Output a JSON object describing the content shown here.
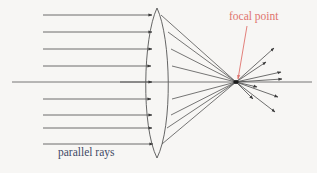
{
  "figure": {
    "kind": "optics-ray-diagram",
    "background_color": "#f7f6f4"
  },
  "labels": {
    "focal_point": {
      "text": "focal point",
      "color": "#e0736d",
      "x": 229,
      "y": 11
    },
    "parallel_rays": {
      "text": "parallel rays",
      "color": "#3f4a66",
      "x": 58,
      "y": 147
    }
  },
  "colors": {
    "ray": "#4a4a4a",
    "lens": "#555555",
    "axis": "#4a4a4a",
    "pointer": "#e0736d",
    "focal_dot": "#1a1a1a"
  },
  "geometry": {
    "lens": {
      "top_apex_x": 157,
      "top_apex_y": 8,
      "bottom_apex_x": 157,
      "bottom_apex_y": 158,
      "left_bulge_x": 141,
      "right_bulge_x": 173,
      "center_y": 83
    },
    "focal_point": {
      "x": 236,
      "y": 82
    },
    "optical_axis": {
      "y": 82,
      "x_start": 12,
      "x_end": 312
    },
    "incoming_ray_start_x": 43,
    "lens_hit_x": 152
  },
  "incoming_rays": [
    {
      "id": 1,
      "y": 15,
      "start_x": 43,
      "end_x": 152
    },
    {
      "id": 2,
      "y": 32,
      "start_x": 43,
      "end_x": 152
    },
    {
      "id": 3,
      "y": 49,
      "start_x": 43,
      "end_x": 152
    },
    {
      "id": 4,
      "y": 66,
      "start_x": 43,
      "end_x": 152
    },
    {
      "id": 5,
      "y": 82,
      "start_x": 12,
      "end_x": 152
    },
    {
      "id": 6,
      "y": 99,
      "start_x": 43,
      "end_x": 152
    },
    {
      "id": 7,
      "y": 115,
      "start_x": 43,
      "end_x": 152
    },
    {
      "id": 8,
      "y": 128,
      "start_x": 43,
      "end_x": 152
    },
    {
      "id": 9,
      "y": 144,
      "start_x": 43,
      "end_x": 152
    }
  ],
  "refracted_rays": [
    {
      "id": 1,
      "from_x": 166,
      "from_y": 18,
      "to_x": 236,
      "to_y": 82
    },
    {
      "id": 2,
      "from_x": 170,
      "from_y": 34,
      "to_x": 236,
      "to_y": 82
    },
    {
      "id": 3,
      "from_x": 172,
      "from_y": 50,
      "to_x": 236,
      "to_y": 82
    },
    {
      "id": 4,
      "from_x": 173,
      "from_y": 66,
      "to_x": 236,
      "to_y": 82
    },
    {
      "id": 5,
      "from_x": 173,
      "from_y": 82,
      "to_x": 236,
      "to_y": 82
    },
    {
      "id": 6,
      "from_x": 173,
      "from_y": 99,
      "to_x": 236,
      "to_y": 82
    },
    {
      "id": 7,
      "from_x": 172,
      "from_y": 114,
      "to_x": 236,
      "to_y": 82
    },
    {
      "id": 8,
      "from_x": 169,
      "from_y": 129,
      "to_x": 236,
      "to_y": 82
    },
    {
      "id": 9,
      "from_x": 165,
      "from_y": 145,
      "to_x": 236,
      "to_y": 82
    }
  ],
  "diverging_rays": [
    {
      "id": 1,
      "to_x": 276,
      "to_y": 47
    },
    {
      "id": 2,
      "to_x": 268,
      "to_y": 61
    },
    {
      "id": 3,
      "to_x": 283,
      "to_y": 71
    },
    {
      "id": 4,
      "id_note": "axis",
      "to_x": 312,
      "to_y": 82
    },
    {
      "id": 5,
      "to_x": 284,
      "to_y": 80
    },
    {
      "id": 6,
      "to_x": 259,
      "to_y": 87
    },
    {
      "id": 7,
      "to_x": 255,
      "to_y": 99
    },
    {
      "id": 8,
      "to_x": 280,
      "to_y": 97
    },
    {
      "id": 9,
      "to_x": 277,
      "to_y": 112
    }
  ],
  "pointer_arrow": {
    "from_x": 247,
    "from_y": 26,
    "to_x": 238,
    "to_y": 79,
    "color": "#e0736d"
  }
}
